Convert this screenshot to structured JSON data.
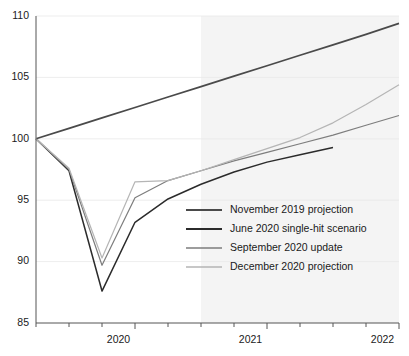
{
  "chart_data": {
    "type": "line",
    "title": "",
    "subtitle": "",
    "xlabel": "",
    "ylabel": "",
    "ylim": [
      85,
      110
    ],
    "xlim": [
      2019.75,
      2022.5
    ],
    "yticks": [
      "85",
      "90",
      "95",
      "100",
      "105",
      "110"
    ],
    "ytick_values": [
      85,
      90,
      95,
      100,
      105,
      110
    ],
    "xticks": [
      "2020",
      "2021",
      "2022"
    ],
    "xtick_values": [
      2020.5,
      2021.5,
      2022.5
    ],
    "xtick_label_positions": [
      2020.375,
      2021.375,
      2022.375
    ],
    "grid": true,
    "legend_position": "center-right",
    "shaded_forecast_region": {
      "start": 2021.0,
      "end": 2022.5,
      "color": "#f4f4f4",
      "label": ""
    },
    "baseline_value": 100,
    "x": [
      2019.75,
      2020.0,
      2020.25,
      2020.5,
      2020.75,
      2021.0,
      2021.25,
      2021.5,
      2021.75,
      2022.0,
      2022.25,
      2022.5
    ],
    "series": [
      {
        "name": "November 2019 projection",
        "color": "#4a4a4a",
        "width": 1.7,
        "values": [
          100.0,
          100.85,
          101.7,
          102.55,
          103.4,
          104.25,
          105.1,
          105.95,
          106.8,
          107.65,
          108.5,
          109.4
        ]
      },
      {
        "name": "June 2020 single-hit scenario",
        "color": "#2b2b2b",
        "width": 1.5,
        "values": [
          100.0,
          97.4,
          87.6,
          93.2,
          95.1,
          96.3,
          97.3,
          98.1,
          98.7,
          99.3,
          null,
          null
        ]
      },
      {
        "name": "September 2020 update",
        "color": "#7d7d7d",
        "width": 1.2,
        "values": [
          100.0,
          97.5,
          89.7,
          95.2,
          96.6,
          97.4,
          98.2,
          98.9,
          99.6,
          100.3,
          101.1,
          101.9
        ]
      },
      {
        "name": "December 2020 projection",
        "color": "#b5b5b5",
        "width": 1.2,
        "values": [
          100.0,
          97.6,
          90.3,
          96.5,
          96.6,
          97.4,
          98.3,
          99.2,
          100.1,
          101.3,
          102.8,
          104.4
        ]
      }
    ]
  },
  "legend": {
    "items": [
      {
        "label": "November 2019 projection"
      },
      {
        "label": "June 2020 single-hit scenario"
      },
      {
        "label": "September 2020 update"
      },
      {
        "label": "December 2020 projection"
      }
    ]
  }
}
